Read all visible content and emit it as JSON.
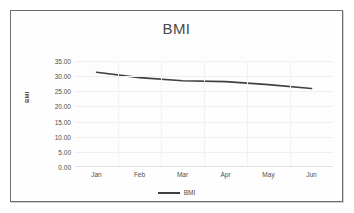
{
  "chart_data": {
    "type": "line",
    "title": "BMI",
    "xlabel": "",
    "ylabel": "BMI",
    "categories": [
      "Jan",
      "Feb",
      "Mar",
      "Apr",
      "May",
      "Jun"
    ],
    "series": [
      {
        "name": "BMI",
        "values": [
          31.3,
          29.5,
          28.5,
          28.2,
          27.2,
          25.9
        ]
      }
    ],
    "ylim": [
      0,
      35
    ],
    "ytick_step": 5,
    "ytick_labels": [
      "35.00",
      "30.00",
      "25.00",
      "20.00",
      "15.00",
      "10.00",
      "5.00",
      "0.00"
    ],
    "ytick_values": [
      35,
      30,
      25,
      20,
      15,
      10,
      5,
      0
    ],
    "grid": true,
    "legend_position": "bottom",
    "line_color": "#404040",
    "gridline_color": "#efefef",
    "plot_background": "#fdfdfd",
    "frame_border_color": "#6e6e6e"
  },
  "legend": {
    "entries": [
      {
        "label": "BMI",
        "marker": "line-marker"
      }
    ]
  }
}
